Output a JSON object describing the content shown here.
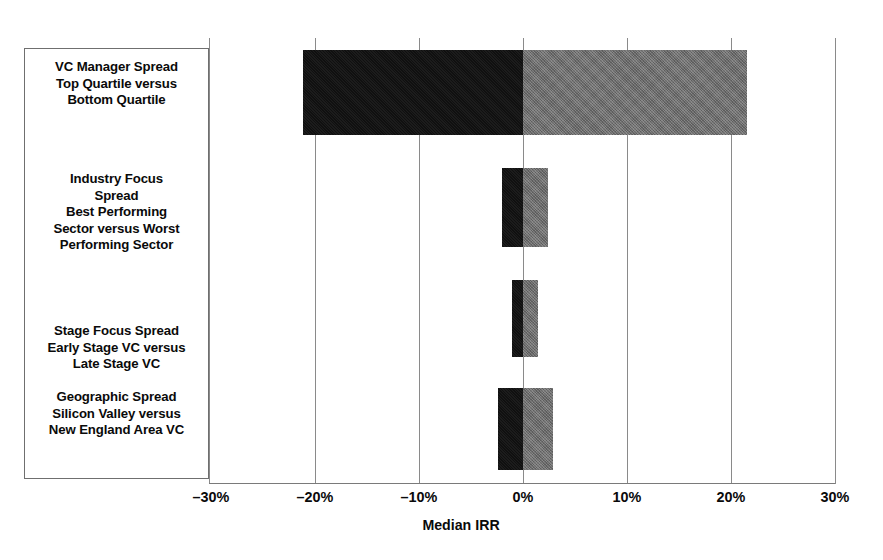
{
  "chart_data": {
    "type": "bar",
    "orientation": "horizontal",
    "title": "",
    "xlabel": "Median IRR",
    "ylabel": "",
    "xlim": [
      -30,
      30
    ],
    "xtick_labels": [
      "–30%",
      "–20%",
      "–10%",
      "0%",
      "10%",
      "20%",
      "30%"
    ],
    "xtick_values": [
      -30,
      -20,
      -10,
      0,
      10,
      20,
      30
    ],
    "grid": true,
    "legend": "none",
    "unit": "percent",
    "colors": {
      "negative_segment": "#101010",
      "positive_segment": "#6d6d6d",
      "gridline": "#8a8a8a",
      "text": "#0a0a0a"
    },
    "categories": [
      {
        "lines": [
          "VC Manager Spread",
          "Top Quartile versus",
          "Bottom Quartile"
        ],
        "low": -21.2,
        "high": 21.5
      },
      {
        "lines": [
          "Industry Focus",
          "Spread",
          "Best Performing",
          "Sector versus Worst",
          "Performing Sector"
        ],
        "low": -2.0,
        "high": 2.4
      },
      {
        "lines": [
          "Stage Focus Spread",
          "Early Stage VC versus",
          "Late Stage VC"
        ],
        "low": -1.1,
        "high": 1.4
      },
      {
        "lines": [
          "Geographic Spread",
          "Silicon Valley versus",
          "New England Area VC"
        ],
        "low": -2.4,
        "high": 2.9
      }
    ]
  }
}
